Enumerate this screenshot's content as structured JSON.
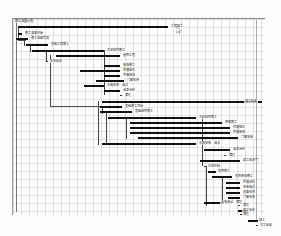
{
  "diagram": {
    "type": "gantt-network-schedule",
    "title": "施工进度计划",
    "tasks": [
      {
        "id": "t1",
        "label": "工程竣工",
        "x": 18,
        "y": 26,
        "w": 150,
        "lx": 170,
        "ly": 24
      },
      {
        "id": "t2",
        "label": "施工准备开始",
        "x": 18,
        "y": 33,
        "w": 4,
        "lx": 24,
        "ly": 31
      },
      {
        "id": "t3",
        "label": "施工准备完成",
        "x": 16,
        "y": 38,
        "w": 12,
        "lx": 30,
        "ly": 36
      },
      {
        "id": "t4",
        "label": "基础工程施工",
        "x": 26,
        "y": 44,
        "w": 22,
        "lx": 50,
        "ly": 42
      },
      {
        "id": "t5",
        "label": "主体结构施工",
        "x": 32,
        "y": 50,
        "w": 72,
        "lx": 106,
        "ly": 48
      },
      {
        "id": "t6",
        "label": "屋面工程",
        "x": 56,
        "y": 55,
        "w": 64,
        "lx": 122,
        "ly": 53
      },
      {
        "id": "t7",
        "label": "主体验收",
        "x": 46,
        "y": 61,
        "w": 2,
        "lx": 49,
        "ly": 59
      },
      {
        "id": "t8",
        "label": "装饰施工",
        "x": 104,
        "y": 65,
        "w": 16,
        "lx": 122,
        "ly": 63
      },
      {
        "id": "t9",
        "label": "内墙抹灰",
        "x": 80,
        "y": 70,
        "w": 40,
        "lx": 122,
        "ly": 68
      },
      {
        "id": "t10",
        "label": "外墙装饰",
        "x": 104,
        "y": 75,
        "w": 16,
        "lx": 122,
        "ly": 73
      },
      {
        "id": "t11",
        "label": "门窗安装",
        "x": 96,
        "y": 80,
        "w": 28,
        "lx": 126,
        "ly": 78
      },
      {
        "id": "t12",
        "label": "水电安装、调试",
        "x": 84,
        "y": 85,
        "w": 20,
        "lx": 106,
        "ly": 83
      },
      {
        "id": "t13",
        "label": "油漆涂料",
        "x": 104,
        "y": 90,
        "w": 16,
        "lx": 122,
        "ly": 88
      },
      {
        "id": "t14",
        "label": "清理",
        "x": 120,
        "y": 95,
        "w": 2,
        "lx": 124,
        "ly": 93
      },
      {
        "id": "t15",
        "label": "竣工验收",
        "x": 102,
        "y": 101,
        "w": 160,
        "lx": 244,
        "ly": 99
      },
      {
        "id": "t16",
        "label": "基础施工开始",
        "x": 100,
        "y": 106,
        "w": 22,
        "lx": 124,
        "ly": 104
      },
      {
        "id": "t17",
        "label": "基础结构施工",
        "x": 100,
        "y": 111,
        "w": 32,
        "lx": 134,
        "ly": 109
      },
      {
        "id": "t18",
        "label": "主体结构施工",
        "x": 108,
        "y": 117,
        "w": 88,
        "lx": 198,
        "ly": 115
      },
      {
        "id": "t19",
        "label": "砌筑施工",
        "x": 130,
        "y": 122,
        "w": 92,
        "lx": 224,
        "ly": 120
      },
      {
        "id": "t20",
        "label": "内墙抹灰",
        "x": 130,
        "y": 127,
        "w": 100,
        "lx": 232,
        "ly": 125
      },
      {
        "id": "t21",
        "label": "外墙装饰",
        "x": 130,
        "y": 132,
        "w": 100,
        "lx": 232,
        "ly": 130
      },
      {
        "id": "t22",
        "label": "门窗安装",
        "x": 138,
        "y": 137,
        "w": 100,
        "lx": 240,
        "ly": 135
      },
      {
        "id": "t23",
        "label": "水电安装、调试",
        "x": 102,
        "y": 143,
        "w": 94,
        "lx": 198,
        "ly": 141
      },
      {
        "id": "t24",
        "label": "油漆涂料",
        "x": 204,
        "y": 149,
        "w": 26,
        "lx": 232,
        "ly": 147
      },
      {
        "id": "t25",
        "label": "清理",
        "x": 224,
        "y": 155,
        "w": 2,
        "lx": 228,
        "ly": 153
      },
      {
        "id": "t26",
        "label": "竣工验收完",
        "x": 200,
        "y": 160,
        "w": 40,
        "lx": 242,
        "ly": 158
      },
      {
        "id": "t27",
        "label": "主体开始",
        "x": 204,
        "y": 166,
        "w": 2,
        "lx": 207,
        "ly": 164
      },
      {
        "id": "t28",
        "label": "地面施工",
        "x": 208,
        "y": 171,
        "w": 8,
        "lx": 217,
        "ly": 169
      },
      {
        "id": "t29",
        "label": "地面装饰施工",
        "x": 212,
        "y": 176,
        "w": 20,
        "lx": 234,
        "ly": 174
      },
      {
        "id": "t30",
        "label": "外墙涂料",
        "x": 226,
        "y": 182,
        "w": 14,
        "lx": 242,
        "ly": 180
      },
      {
        "id": "t31",
        "label": "安装调试",
        "x": 226,
        "y": 187,
        "w": 14,
        "lx": 242,
        "ly": 185
      },
      {
        "id": "t32",
        "label": "设备安装",
        "x": 226,
        "y": 192,
        "w": 14,
        "lx": 242,
        "ly": 190
      },
      {
        "id": "t33",
        "label": "门窗安装",
        "x": 228,
        "y": 197,
        "w": 12,
        "lx": 242,
        "ly": 195
      },
      {
        "id": "t34",
        "label": "水电调试、清理",
        "x": 204,
        "y": 202,
        "w": 20,
        "lx": 220,
        "ly": 200
      },
      {
        "id": "t35",
        "label": "清理",
        "x": 238,
        "y": 205,
        "w": 2,
        "lx": 242,
        "ly": 203
      },
      {
        "id": "t36",
        "label": "竣工验收",
        "x": 238,
        "y": 210,
        "w": 10,
        "lx": 242,
        "ly": 208
      },
      {
        "id": "t37",
        "label": "清理",
        "x": 240,
        "y": 214,
        "w": 2,
        "lx": 242,
        "ly": 212
      },
      {
        "id": "t38",
        "label": "竣工",
        "x": 248,
        "y": 220,
        "w": 10,
        "lx": 258,
        "ly": 218
      },
      {
        "id": "t39",
        "label": "交工验收",
        "x": 256,
        "y": 225,
        "w": 2,
        "lx": 259,
        "ly": 223
      }
    ],
    "connectors": {
      "vertical": [
        {
          "x": 18,
          "y": 26,
          "h": 14
        },
        {
          "x": 24,
          "y": 38,
          "h": 8
        },
        {
          "x": 30,
          "y": 44,
          "h": 8
        },
        {
          "x": 46,
          "y": 50,
          "h": 11
        },
        {
          "x": 50,
          "y": 55,
          "h": 52
        },
        {
          "x": 104,
          "y": 50,
          "h": 45
        },
        {
          "x": 98,
          "y": 101,
          "h": 44
        },
        {
          "x": 102,
          "y": 106,
          "h": 8
        },
        {
          "x": 106,
          "y": 111,
          "h": 32
        },
        {
          "x": 126,
          "y": 117,
          "h": 22
        },
        {
          "x": 202,
          "y": 116,
          "h": 50
        },
        {
          "x": 206,
          "y": 166,
          "h": 40
        },
        {
          "x": 222,
          "y": 176,
          "h": 26
        }
      ],
      "horizontal": [
        {
          "x": 50,
          "y": 106,
          "w": 50
        },
        {
          "x": 18,
          "y": 40,
          "w": 8
        }
      ]
    }
  },
  "cursor": {
    "icon": "mouse-pointer-icon"
  }
}
